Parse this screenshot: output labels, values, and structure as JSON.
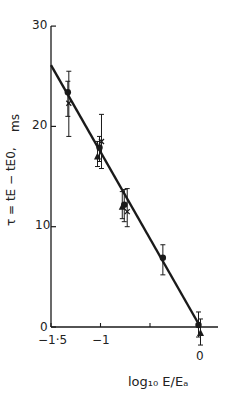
{
  "chart_data": {
    "type": "scatter",
    "title": "",
    "xlabel": "log10 E/Ea",
    "ylabel": "τ = tE − tE0, ms",
    "xlim": [
      -1.5,
      0.1
    ],
    "ylim": [
      0,
      30
    ],
    "x_ticks": [
      -1.5,
      -1,
      0
    ],
    "x_tick_labels": [
      "-1·5",
      "-1",
      "0"
    ],
    "y_ticks": [
      0,
      10,
      20,
      30
    ],
    "y_tick_labels": [
      "0",
      "10",
      "20",
      "30"
    ],
    "y_unit": "ms",
    "grid": false,
    "legend": null,
    "fit_line": {
      "x": [
        -1.5,
        -0.02
      ],
      "y": [
        26.1,
        0.5
      ]
    },
    "series": [
      {
        "name": "circles",
        "marker": "filled-circle",
        "points": [
          {
            "x": -1.33,
            "y": 23.4,
            "err_low": 21.0,
            "err_high": 24.5
          },
          {
            "x": -1.01,
            "y": 17.9,
            "err_low": 16.5,
            "err_high": 19.0
          },
          {
            "x": -0.76,
            "y": 12.2,
            "err_low": 10.5,
            "err_high": 13.7
          },
          {
            "x": -0.37,
            "y": 6.9,
            "err_low": 5.2,
            "err_high": 8.2
          },
          {
            "x": -0.01,
            "y": 0.2,
            "err_low": -1.0,
            "err_high": 1.5
          }
        ]
      },
      {
        "name": "triangles",
        "marker": "filled-triangle",
        "points": [
          {
            "x": -1.03,
            "y": 17.0,
            "err_low": 16.0,
            "err_high": 18.5
          },
          {
            "x": -0.78,
            "y": 12.0,
            "err_low": 10.8,
            "err_high": 13.5
          },
          {
            "x": 0.01,
            "y": -0.6,
            "err_low": -1.8,
            "err_high": 0.8
          }
        ]
      },
      {
        "name": "crosses",
        "marker": "cross",
        "points": [
          {
            "x": -1.32,
            "y": 22.3,
            "err_low": 19.0,
            "err_high": 25.5
          },
          {
            "x": -0.99,
            "y": 18.5,
            "err_low": 15.8,
            "err_high": 21.2
          },
          {
            "x": -0.73,
            "y": 11.5,
            "err_low": 10.0,
            "err_high": 13.8
          }
        ]
      }
    ]
  },
  "labels": {
    "y_unit": "ms",
    "y_axis_formula": "τ = tE − tE0,",
    "x_axis": "log₁₀ E/Eₐ",
    "x_tick_-1_5": "−1·5",
    "x_tick_-1": "−1",
    "x_tick_0": "0",
    "y_tick_0": "0",
    "y_tick_10": "10",
    "y_tick_20": "20",
    "y_tick_30": "30"
  }
}
